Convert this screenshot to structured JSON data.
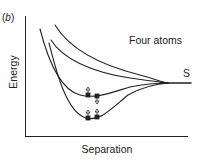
{
  "figure": {
    "panel_label_open": "(",
    "panel_label_letter": "b",
    "panel_label_close": ")",
    "y_axis_label": "Energy",
    "x_axis_label": "Separation",
    "annotations": {
      "four_atoms": "Four atoms",
      "s_label": "S"
    },
    "curves": [
      {
        "name": "repulsive-upper",
        "type": "repulsive"
      },
      {
        "name": "repulsive-lower",
        "type": "repulsive"
      },
      {
        "name": "bound-upper",
        "type": "attractive",
        "minimum_marker": "atom pair with spin arrows"
      },
      {
        "name": "bound-lower",
        "type": "attractive",
        "minimum_marker": "atom pair with spin arrows"
      }
    ],
    "colors": {
      "line": "#222222",
      "background": "#ffffff"
    }
  }
}
